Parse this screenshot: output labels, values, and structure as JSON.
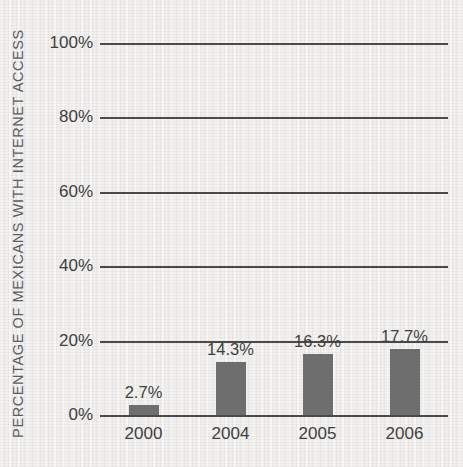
{
  "chart_data": {
    "type": "bar",
    "title": "",
    "subtitle": "",
    "xlabel": "",
    "ylabel": "PERCENTAGE OF MEXICANS WITH INTERNET ACCESS",
    "categories": [
      "2000",
      "2004",
      "2005",
      "2006"
    ],
    "values": [
      2.7,
      14.3,
      16.3,
      17.7
    ],
    "value_labels": [
      "2.7%",
      "14.3%",
      "16.3%",
      "17.7%"
    ],
    "ylim": [
      0,
      100
    ],
    "yticks": [
      0,
      20,
      40,
      60,
      80,
      100
    ],
    "ytick_labels": [
      "0%",
      "20%",
      "40%",
      "60%",
      "80%",
      "100%"
    ],
    "grid": true,
    "legend": false,
    "legend_position": "none",
    "colors": {
      "bar": "#6e6e6e",
      "gridline": "#4a4a4a",
      "text": "#3f3f3f",
      "axis_title": "#5d5d5d",
      "background": "#f1f0ee"
    }
  }
}
